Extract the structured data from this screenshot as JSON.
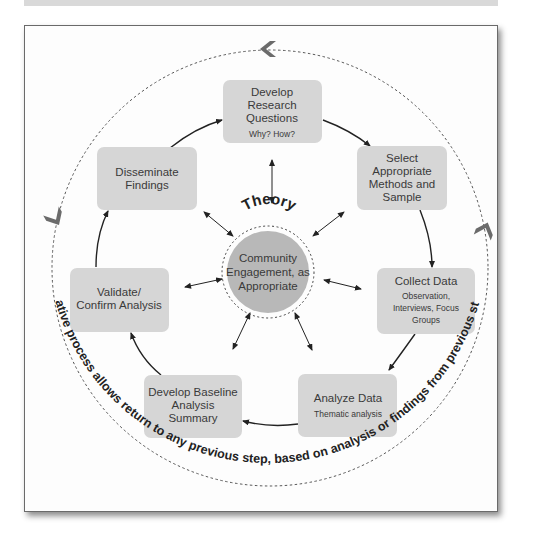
{
  "diagram": {
    "center": {
      "label_line1": "Community",
      "label_line2": "Engagement, as",
      "label_line3": "Appropriate",
      "arc_label": "Theory"
    },
    "steps": [
      {
        "id": "develop-research-questions",
        "title_lines": [
          "Develop",
          "Research",
          "Questions"
        ],
        "subtitle_lines": [
          "Why? How?"
        ]
      },
      {
        "id": "select-methods",
        "title_lines": [
          "Select",
          "Appropriate",
          "Methods and",
          "Sample"
        ],
        "subtitle_lines": []
      },
      {
        "id": "collect-data",
        "title_lines": [
          "Collect Data"
        ],
        "subtitle_lines": [
          "Observation,",
          "Interviews, Focus",
          "Groups"
        ]
      },
      {
        "id": "analyze-data",
        "title_lines": [
          "Analyze Data"
        ],
        "subtitle_lines": [
          "Thematic analysis"
        ]
      },
      {
        "id": "develop-baseline",
        "title_lines": [
          "Develop Baseline",
          "Analysis",
          "Summary"
        ],
        "subtitle_lines": []
      },
      {
        "id": "validate-confirm",
        "title_lines": [
          "Validate/",
          "Confirm Analysis"
        ],
        "subtitle_lines": []
      },
      {
        "id": "disseminate-findings",
        "title_lines": [
          "Disseminate",
          "Findings"
        ],
        "subtitle_lines": []
      }
    ],
    "outer_loop_label": "Iterative process allows return to any previous step, based on analysis or findings from previous steps",
    "colors": {
      "box_fill": "#d6d6d6",
      "center_fill": "#b8b8b8",
      "chevron": "#6b6b6b",
      "arrow": "#222222",
      "dashed": "#555555",
      "top_bar": "#d9d9d9"
    }
  }
}
